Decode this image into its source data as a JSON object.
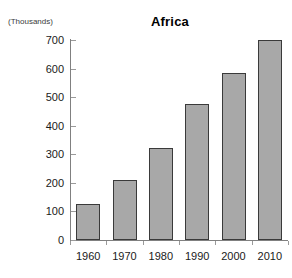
{
  "chart_data": {
    "type": "bar",
    "title": "Africa",
    "xlabel": "",
    "ylabel": "(Thousands)",
    "categories": [
      "1960",
      "1970",
      "1980",
      "1990",
      "2000",
      "2010"
    ],
    "values": [
      126,
      210,
      322,
      476,
      585,
      700
    ],
    "yticks": [
      0,
      100,
      200,
      300,
      400,
      500,
      600,
      700
    ],
    "ylim": [
      0,
      700
    ],
    "grid": false,
    "legend": null,
    "legend_position": "none",
    "series": [
      {
        "name": "Africa",
        "values": [
          126,
          210,
          322,
          476,
          585,
          700
        ]
      }
    ],
    "colors": {
      "bar_fill": "#a8a8a8",
      "bar_border": "#3a3a3a",
      "axis": "#808080",
      "text": "#1a1a1a",
      "background": "#ffffff"
    }
  }
}
